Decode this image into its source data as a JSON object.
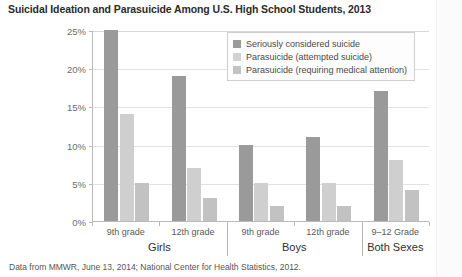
{
  "title": "Suicidal Ideation and Parasuicide Among U.S. High School Students, 2013",
  "footnote": "Data from MMWR, June 13, 2014; National Center for Health Statistics, 2012.",
  "colors": {
    "series0": "#9a9a9a",
    "series1": "#cfcfcf",
    "series2": "#c2c2c2",
    "axis": "#b9b9b9",
    "grid": "#e2e2e2"
  },
  "axis": {
    "y_ticks": [
      "0%",
      "5%",
      "10%",
      "15%",
      "20%",
      "25%"
    ],
    "y_min": 0,
    "y_max": 25
  },
  "groups": [
    {
      "sub": "9th grade",
      "parent": "Girls"
    },
    {
      "sub": "12th grade",
      "parent": "Girls"
    },
    {
      "sub": "9th grade",
      "parent": "Boys"
    },
    {
      "sub": "12th grade",
      "parent": "Boys"
    },
    {
      "sub": "9–12 Grade",
      "parent": "Both Sexes"
    }
  ],
  "parents": [
    "Girls",
    "Boys",
    "Both Sexes"
  ],
  "legend": {
    "position": "top-right",
    "items": [
      "Seriously considered suicide",
      "Parasuicide (attempted suicide)",
      "Parasuicide (requiring medical attention)"
    ]
  },
  "chart_data": {
    "type": "bar",
    "title": "Suicidal Ideation and Parasuicide Among U.S. High School Students, 2013",
    "xlabel": "",
    "ylabel": "",
    "ylim": [
      0,
      25
    ],
    "ytick_labels": [
      "0%",
      "5%",
      "10%",
      "15%",
      "20%",
      "25%"
    ],
    "grid": true,
    "legend_position": "top-right",
    "categories": [
      "9th grade (Girls)",
      "12th grade (Girls)",
      "9th grade (Boys)",
      "12th grade (Boys)",
      "9–12 Grade (Both Sexes)"
    ],
    "series": [
      {
        "name": "Seriously considered suicide",
        "values": [
          25,
          19,
          10,
          11,
          17
        ]
      },
      {
        "name": "Parasuicide (attempted suicide)",
        "values": [
          14,
          7,
          5,
          5,
          8
        ]
      },
      {
        "name": "Parasuicide (requiring medical attention)",
        "values": [
          5,
          3,
          2,
          2,
          4
        ]
      }
    ],
    "annotations": [
      "Data from MMWR, June 13, 2014; National Center for Health Statistics, 2012."
    ]
  }
}
